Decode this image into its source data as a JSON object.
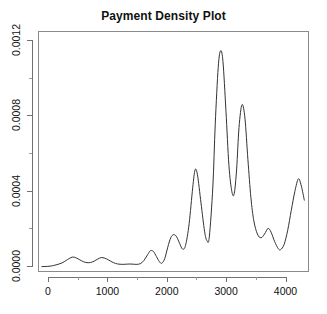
{
  "chart_data": {
    "type": "line",
    "title": "Payment Density Plot",
    "xlabel": "",
    "ylabel": "",
    "xlim": [
      -150,
      4350
    ],
    "ylim": [
      0,
      0.0012
    ],
    "grid": false,
    "legend": "none",
    "line_color": "#333333",
    "background": "#ffffff",
    "box_color": "#8a8a8a",
    "x_ticks": [
      0,
      1000,
      2000,
      3000,
      4000
    ],
    "x_tick_labels": [
      "0",
      "1000",
      "2000",
      "3000",
      "4000"
    ],
    "x_minor_ticks": [
      500,
      1500,
      2500,
      3500
    ],
    "y_ticks": [
      0.0,
      0.0004,
      0.0008,
      0.0012
    ],
    "y_tick_labels": [
      "0.0000",
      "0.0004",
      "0.0008",
      "0.0012"
    ],
    "y_minor_ticks": [
      0.0002,
      0.0006,
      0.001
    ],
    "series": [
      {
        "name": "payment density",
        "x": [
          -120,
          0,
          80,
          150,
          220,
          290,
          340,
          400,
          460,
          520,
          580,
          640,
          700,
          760,
          820,
          880,
          940,
          1000,
          1060,
          1120,
          1180,
          1240,
          1300,
          1360,
          1420,
          1480,
          1540,
          1600,
          1660,
          1710,
          1760,
          1810,
          1860,
          1900,
          1950,
          2000,
          2050,
          2100,
          2150,
          2200,
          2250,
          2300,
          2360,
          2420,
          2460,
          2500,
          2560,
          2620,
          2660,
          2700,
          2760,
          2800,
          2850,
          2890,
          2930,
          2980,
          3030,
          3080,
          3120,
          3160,
          3200,
          3250,
          3300,
          3350,
          3400,
          3450,
          3510,
          3570,
          3630,
          3690,
          3740,
          3800,
          3860,
          3900,
          3960,
          4020,
          4080,
          4140,
          4200,
          4250,
          4300
        ],
        "y": [
          2e-06,
          4e-06,
          8e-06,
          1.4e-05,
          2.2e-05,
          3.5e-05,
          4.5e-05,
          5.3e-05,
          4.8e-05,
          3.8e-05,
          2.8e-05,
          2.3e-05,
          2.4e-05,
          3.1e-05,
          4.2e-05,
          5e-05,
          4.7e-05,
          3.8e-05,
          2.7e-05,
          1.9e-05,
          1.5e-05,
          1.4e-05,
          1.5e-05,
          1.6e-05,
          1.5e-05,
          1.4e-05,
          1.8e-05,
          3.5e-05,
          6.5e-05,
          8.7e-05,
          8.2e-05,
          5.5e-05,
          2.8e-05,
          2e-05,
          4.5e-05,
          0.000105,
          0.000155,
          0.000172,
          0.00016,
          0.000125,
          9.5e-05,
          0.000115,
          0.00023,
          0.00042,
          0.000515,
          0.00049,
          0.00034,
          0.00019,
          0.00014,
          0.00016,
          0.00043,
          0.00076,
          0.00106,
          0.001148,
          0.00109,
          0.00083,
          0.00054,
          0.0004,
          0.00039,
          0.00052,
          0.00074,
          0.000862,
          0.00079,
          0.00057,
          0.00037,
          0.000245,
          0.000175,
          0.000155,
          0.000175,
          0.000205,
          0.000185,
          0.000135,
          9.8e-05,
          9.2e-05,
          0.00012,
          0.000195,
          0.0003,
          0.0004,
          0.000468,
          0.00043,
          0.000355
        ]
      }
    ]
  }
}
